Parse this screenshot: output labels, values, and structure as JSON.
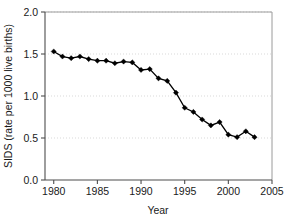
{
  "chart_data": {
    "type": "line",
    "title": "",
    "xlabel": "Year",
    "ylabel": "SIDS (rate per 1000 live births)",
    "xlim": [
      1979,
      2005
    ],
    "ylim": [
      0.0,
      2.0
    ],
    "xticks": [
      1980,
      1985,
      1990,
      1995,
      2000,
      2005
    ],
    "xtick_labels": [
      "1980",
      "1985",
      "1990",
      "1995",
      "2000",
      "2005"
    ],
    "yticks": [
      0.0,
      0.5,
      1.0,
      1.5,
      2.0
    ],
    "ytick_labels": [
      "0.0",
      "0.5",
      "1.0",
      "1.5",
      "2.0"
    ],
    "grid": true,
    "grid_axis": "y",
    "legend": false,
    "marker": "diamond",
    "marker_color": "#000000",
    "line_color": "#000000",
    "x": [
      1980,
      1981,
      1982,
      1983,
      1984,
      1985,
      1986,
      1987,
      1988,
      1989,
      1990,
      1991,
      1992,
      1993,
      1994,
      1995,
      1996,
      1997,
      1998,
      1999,
      2000,
      2001,
      2002,
      2003
    ],
    "values": [
      1.53,
      1.47,
      1.45,
      1.47,
      1.44,
      1.42,
      1.42,
      1.39,
      1.41,
      1.4,
      1.31,
      1.32,
      1.21,
      1.18,
      1.04,
      0.86,
      0.81,
      0.72,
      0.65,
      0.69,
      0.54,
      0.51,
      0.58,
      0.51
    ],
    "series": [
      {
        "name": "SIDS rate",
        "values": [
          1.53,
          1.47,
          1.45,
          1.47,
          1.44,
          1.42,
          1.42,
          1.39,
          1.41,
          1.4,
          1.31,
          1.32,
          1.21,
          1.18,
          1.04,
          0.86,
          0.81,
          0.72,
          0.65,
          0.69,
          0.54,
          0.51,
          0.58,
          0.51
        ]
      }
    ]
  },
  "colors": {
    "background": "#ffffff",
    "axis": "#4d4d4d",
    "grid": "#d9d9d9",
    "data": "#000000",
    "text": "#1a1a1a"
  }
}
